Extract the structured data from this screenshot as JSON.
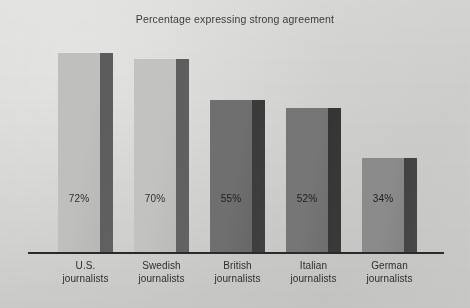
{
  "figure": {
    "title": "Percentage expressing strong agreement",
    "background_color": "#d6d6d4",
    "axis_color": "#2a2a2a"
  },
  "chart_data": {
    "type": "bar",
    "title": "Percentage expressing strong agreement",
    "xlabel": "",
    "ylabel": "",
    "ylim": [
      0,
      80
    ],
    "grid": false,
    "legend": "none",
    "orientation": "vertical",
    "value_suffix": "%",
    "categories": [
      "U.S. journalists",
      "Swedish journalists",
      "British journalists",
      "Italian journalists",
      "German journalists"
    ],
    "category_lines": [
      [
        "U.S.",
        "journalists"
      ],
      [
        "Swedish",
        "journalists"
      ],
      [
        "British",
        "journalists"
      ],
      [
        "Italian",
        "journalists"
      ],
      [
        "German",
        "journalists"
      ]
    ],
    "values": [
      72,
      70,
      55,
      52,
      34
    ],
    "data_labels": [
      "72%",
      "70%",
      "55%",
      "52%",
      "34%"
    ],
    "bar_colors": [
      "#bfbfbd",
      "#c2c2c0",
      "#6f6f6f",
      "#767676",
      "#8b8b8b"
    ],
    "bar_side_colors": [
      "#5b5b5b",
      "#5d5d5d",
      "#3a3a3a",
      "#343434",
      "#424242"
    ]
  },
  "bars": [
    {
      "category": "U.S. journalists",
      "line1": "U.S.",
      "line2": "journalists",
      "value": 72,
      "label": "72%",
      "color": "#bfbfbd",
      "side_color": "#5b5b5b",
      "label_dark": false
    },
    {
      "category": "Swedish journalists",
      "line1": "Swedish",
      "line2": "journalists",
      "value": 70,
      "label": "70%",
      "color": "#c2c2c0",
      "side_color": "#5d5d5d",
      "label_dark": false
    },
    {
      "category": "British journalists",
      "line1": "British",
      "line2": "journalists",
      "value": 55,
      "label": "55%",
      "color": "#6f6f6f",
      "side_color": "#3a3a3a",
      "label_dark": true
    },
    {
      "category": "Italian journalists",
      "line1": "Italian",
      "line2": "journalists",
      "value": 52,
      "label": "52%",
      "color": "#767676",
      "side_color": "#343434",
      "label_dark": true
    },
    {
      "category": "German journalists",
      "line1": "German",
      "line2": "journalists",
      "value": 34,
      "label": "34%",
      "color": "#8b8b8b",
      "side_color": "#424242",
      "label_dark": true
    }
  ]
}
